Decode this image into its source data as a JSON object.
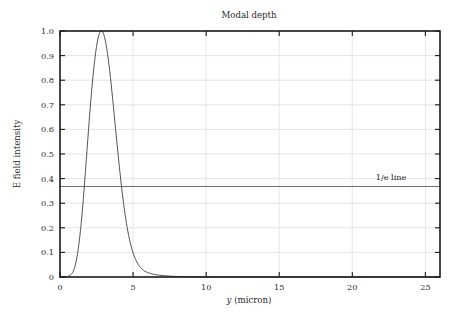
{
  "figure": {
    "title": "Modal depth",
    "background_color": "#ffffff",
    "frame_color": "#1b1b1b",
    "grid_color": "#d9d9d9",
    "curve_color": "#555555",
    "reference_line_color": "#6b6b6b"
  },
  "axes": {
    "x_label_var": "y",
    "x_label_unit": " (micron)",
    "x_label_full": "y (micron)",
    "y_label": "E field intensity",
    "x_ticks": [
      "0",
      "5",
      "10",
      "15",
      "20",
      "25"
    ],
    "y_ticks": [
      "0",
      "0.1",
      "0.2",
      "0.3",
      "0.4",
      "0.5",
      "0.6",
      "0.7",
      "0.8",
      "0.9",
      "1.0"
    ]
  },
  "annotations": {
    "one_over_e": "1/e line"
  },
  "chart_data": {
    "type": "line",
    "title": "Modal depth",
    "xlabel": "y (micron)",
    "ylabel": "E field intensity",
    "xlim": [
      0,
      26
    ],
    "ylim": [
      0,
      1.0
    ],
    "xticks": [
      0,
      5,
      10,
      15,
      20,
      25
    ],
    "yticks": [
      0,
      0.1,
      0.2,
      0.3,
      0.4,
      0.5,
      0.6,
      0.7,
      0.8,
      0.9,
      1.0
    ],
    "grid": true,
    "legend": "none",
    "series": [
      {
        "name": "E field intensity",
        "color": "#555555",
        "x": [
          0.0,
          0.2,
          0.4,
          0.6,
          0.8,
          1.0,
          1.2,
          1.4,
          1.6,
          1.8,
          2.0,
          2.2,
          2.4,
          2.6,
          2.8,
          3.0,
          3.2,
          3.4,
          3.6,
          3.8,
          4.0,
          4.2,
          4.4,
          4.6,
          4.8,
          5.0,
          5.2,
          5.4,
          5.6,
          5.8,
          6.0,
          6.4,
          6.8,
          7.2,
          7.6,
          8.0,
          8.5,
          9.0,
          9.5,
          10.0,
          11.0,
          12.0,
          13.0,
          14.0,
          16.0,
          18.0,
          20.0,
          22.0,
          24.0,
          26.0
        ],
        "y": [
          0.0,
          0.0,
          0.001,
          0.004,
          0.013,
          0.038,
          0.095,
          0.189,
          0.32,
          0.477,
          0.637,
          0.78,
          0.894,
          0.97,
          1.0,
          0.985,
          0.928,
          0.838,
          0.726,
          0.604,
          0.483,
          0.372,
          0.277,
          0.2,
          0.141,
          0.098,
          0.068,
          0.047,
          0.033,
          0.024,
          0.018,
          0.011,
          0.0072,
          0.0048,
          0.0033,
          0.0023,
          0.0014,
          0.0009,
          0.0006,
          0.0004,
          0.0002,
          0.0001,
          0.0001,
          0.0,
          0.0,
          0.0,
          0.0,
          0.0,
          0.0,
          0.0
        ]
      }
    ],
    "reference_lines": [
      {
        "name": "1/e line",
        "orientation": "horizontal",
        "value": 0.368,
        "label": "1/e line",
        "color": "#6b6b6b"
      }
    ],
    "annotations": [
      {
        "text": "1/e line",
        "x": 21.6,
        "y": 0.395
      }
    ]
  }
}
